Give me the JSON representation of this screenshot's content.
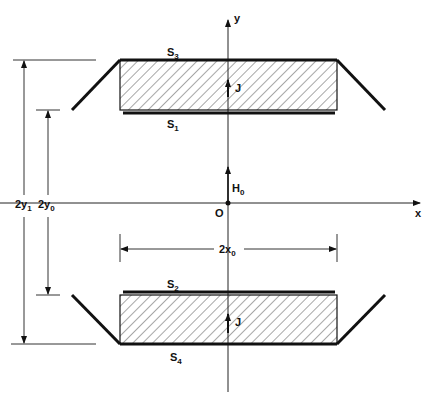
{
  "diagram": {
    "axes": {
      "x_label": "x",
      "y_label": "y",
      "origin_label": "O"
    },
    "field": {
      "label": "H",
      "subscript": "0"
    },
    "current": {
      "label": "J"
    },
    "surfaces": {
      "s1": {
        "label": "S",
        "subscript": "1"
      },
      "s2": {
        "label": "S",
        "subscript": "2"
      },
      "s3": {
        "label": "S",
        "subscript": "3"
      },
      "s4": {
        "label": "S",
        "subscript": "4"
      }
    },
    "dimensions": {
      "outer": {
        "label": "2y",
        "subscript": "1"
      },
      "inner": {
        "label": "2y",
        "subscript": "0"
      },
      "width": {
        "label": "2x",
        "subscript": "0"
      }
    },
    "colors": {
      "ink": "#111111",
      "background": "#ffffff"
    }
  }
}
